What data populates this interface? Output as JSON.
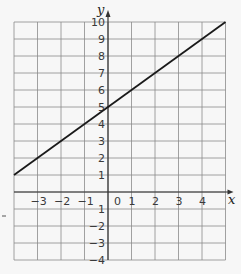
{
  "chart_data": {
    "type": "line",
    "title": "",
    "xlabel": "x",
    "ylabel": "y",
    "xlim": [
      -4,
      5
    ],
    "ylim": [
      -4,
      10
    ],
    "grid": true,
    "x_ticks": [
      -3,
      -2,
      -1,
      0,
      1,
      2,
      3,
      4
    ],
    "y_ticks": [
      -4,
      -3,
      -2,
      -1,
      1,
      2,
      3,
      4,
      5,
      6,
      7,
      8,
      9,
      10
    ],
    "series": [
      {
        "name": "y = x + 5",
        "x": [
          -4,
          5
        ],
        "y": [
          1,
          10
        ],
        "color": "#1a1a1a"
      }
    ]
  },
  "labels": {
    "x_axis": "x",
    "y_axis": "y",
    "x_tick_labels": [
      "−3",
      "−2",
      "−1",
      "0",
      "1",
      "2",
      "3",
      "4"
    ],
    "y_tick_labels_pos": [
      "1",
      "2",
      "3",
      "4",
      "5",
      "6",
      "7",
      "8",
      "9",
      "10"
    ],
    "y_tick_labels_neg": [
      "1",
      "2",
      "3",
      "4"
    ]
  },
  "colors": {
    "grid": "#8a8a8a",
    "axis": "#333333",
    "line": "#1a1a1a",
    "background": "#f7f7f7"
  }
}
